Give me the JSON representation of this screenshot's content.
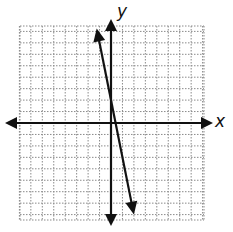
{
  "chart_data": {
    "type": "line",
    "title": "",
    "xlabel": "x",
    "ylabel": "y",
    "xlim": [
      -8,
      8
    ],
    "ylim": [
      -8.5,
      8.5
    ],
    "grid": true,
    "grid_style": "dotted",
    "axes_arrows": true,
    "series": [
      {
        "name": "line",
        "equation": "y = -5x + 2",
        "slope": -5,
        "y_intercept": 2,
        "x": [
          -1.25,
          2.0
        ],
        "y": [
          8.25,
          -8.0
        ],
        "arrows_both_ends": true
      }
    ]
  },
  "labels": {
    "x_axis": "x",
    "y_axis": "y"
  },
  "colors": {
    "axis": "#111111",
    "grid": "#8a8a8a",
    "line": "#111111",
    "background": "#ffffff"
  }
}
